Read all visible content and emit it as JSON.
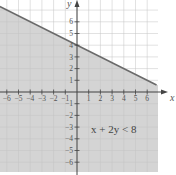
{
  "chart_data": {
    "type": "inequality-graph",
    "title": "",
    "inequality": "x + 2y < 8",
    "boundary_line": {
      "equation": "x + 2y = 8",
      "slope": -0.5,
      "y_intercept": 4,
      "x_intercept": 8
    },
    "shaded_region": "below",
    "xlabel": "x",
    "ylabel": "y",
    "x_ticks": [
      -6,
      -5,
      -4,
      -3,
      -2,
      -1,
      1,
      2,
      3,
      4,
      5,
      6
    ],
    "y_ticks": [
      -6,
      -5,
      -4,
      -3,
      -2,
      -1,
      1,
      2,
      3,
      4,
      5,
      6
    ],
    "xlim": [
      -6.6,
      7
    ],
    "ylim": [
      -6.8,
      7.5
    ],
    "grid": true
  },
  "labels": {
    "x_axis": "x",
    "y_axis": "y",
    "inequality": "x + 2y < 8"
  },
  "colors": {
    "shade": "#d4d4d4",
    "grid": "#c4c4c4",
    "axis": "#444444",
    "line": "#6a6a6a"
  }
}
